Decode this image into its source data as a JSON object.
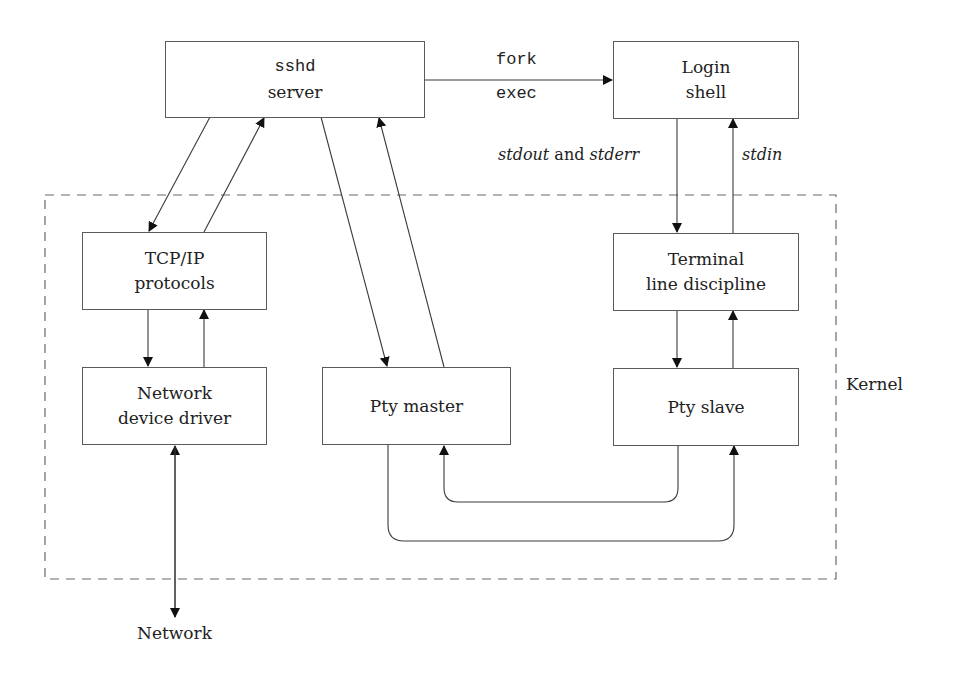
{
  "diagram": {
    "nodes": {
      "sshd": {
        "line1": "sshd",
        "line2": "server"
      },
      "login": {
        "line1": "Login",
        "line2": "shell"
      },
      "tcpip": {
        "line1": "TCP/IP",
        "line2": "protocols"
      },
      "terminal": {
        "line1": "Terminal",
        "line2": "line discipline"
      },
      "netdriver": {
        "line1": "Network",
        "line2": "device driver"
      },
      "ptymaster": {
        "line1": "Pty master"
      },
      "ptyslave": {
        "line1": "Pty slave"
      }
    },
    "edge_labels": {
      "fork": "fork",
      "exec": "exec",
      "stdout": "stdout",
      "and": " and ",
      "stderr": "stderr",
      "stdin": "stdin"
    },
    "region_label": "Kernel",
    "external_label": "Network",
    "colors": {
      "line": "#4a4a4a",
      "dash": "#6a6a6a",
      "text": "#222222"
    }
  }
}
